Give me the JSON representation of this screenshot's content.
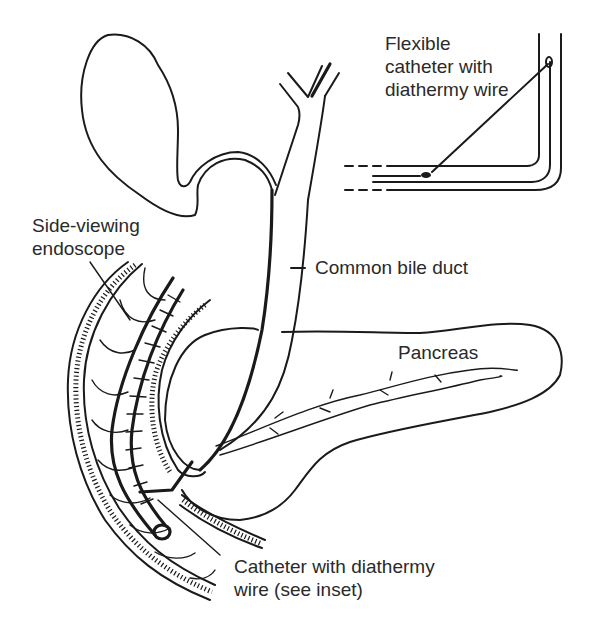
{
  "figure": {
    "type": "anatomical line diagram",
    "stroke_color": "#1a1a1a",
    "background": "#ffffff"
  },
  "labels": {
    "inset": "Flexible\ncatheter with\ndiathermy wire",
    "endoscope": "Side-viewing\nendoscope",
    "bile_duct": "Common bile duct",
    "pancreas": "Pancreas",
    "catheter": "Catheter with diathermy\nwire (see inset)"
  },
  "structures": [
    "gallbladder",
    "cystic duct",
    "hepatic ducts",
    "common bile duct",
    "pancreas",
    "pancreatic duct",
    "duodenum",
    "side-viewing endoscope",
    "catheter with diathermy wire",
    "inset: flexible catheter"
  ]
}
